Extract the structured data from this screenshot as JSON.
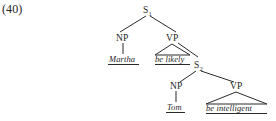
{
  "example": {
    "number": "(40)"
  },
  "tree": {
    "root": {
      "label": "S",
      "subscript": "1"
    },
    "nodes": {
      "np1": "NP",
      "vp1": "VP",
      "s2_label": "S",
      "s2_subscript": "2",
      "np2": "NP",
      "vp2": "VP"
    },
    "terminals": {
      "subject1": "Martha",
      "predicate1": "be likely",
      "subject2": "Tom",
      "predicate2": "be intelligent"
    },
    "colors": {
      "line": "#2b2b2b",
      "text": "#1f1f1f"
    }
  }
}
